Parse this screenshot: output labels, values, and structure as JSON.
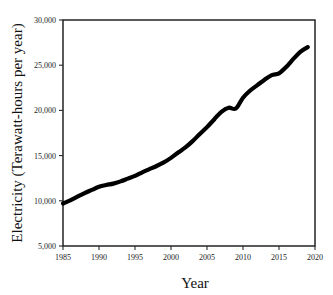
{
  "chart_data": {
    "type": "line",
    "title": "",
    "xlabel": "Year",
    "ylabel": "Electricity (Terawatt-hours per year)",
    "xlim": [
      1985,
      2020
    ],
    "ylim": [
      5000,
      30000
    ],
    "grid": false,
    "legend": "none",
    "xticks": [
      1985,
      1990,
      1995,
      2000,
      2005,
      2010,
      2015,
      2020
    ],
    "xtick_labels": [
      "1985",
      "1990",
      "1995",
      "2000",
      "2005",
      "2010",
      "2015",
      "2020"
    ],
    "yticks": [
      5000,
      10000,
      15000,
      20000,
      25000,
      30000
    ],
    "ytick_labels": [
      "5,000",
      "10,000",
      "15,000",
      "20,000",
      "25,000",
      "30,000"
    ],
    "series": [
      {
        "name": "World electricity generation",
        "color": "#000000",
        "x": [
          1985,
          1986,
          1987,
          1988,
          1989,
          1990,
          1991,
          1992,
          1993,
          1994,
          1995,
          1996,
          1997,
          1998,
          1999,
          2000,
          2001,
          2002,
          2003,
          2004,
          2005,
          2006,
          2007,
          2008,
          2009,
          2010,
          2011,
          2012,
          2013,
          2014,
          2015,
          2016,
          2017,
          2018,
          2019
        ],
        "values": [
          9700,
          10050,
          10450,
          10850,
          11200,
          11550,
          11750,
          11900,
          12150,
          12450,
          12750,
          13150,
          13500,
          13850,
          14250,
          14750,
          15350,
          15900,
          16600,
          17400,
          18150,
          19000,
          19850,
          20300,
          20200,
          21400,
          22200,
          22800,
          23400,
          23900,
          24100,
          24800,
          25700,
          26500,
          27000
        ]
      }
    ]
  },
  "axes": {
    "x_title": "Year",
    "y_title": "Electricity (Terawatt-hours per year)"
  }
}
